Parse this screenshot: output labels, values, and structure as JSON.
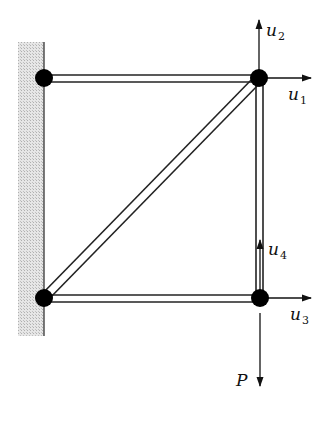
{
  "diagram": {
    "title": "",
    "nodes": [
      {
        "id": "top-left",
        "support": "wall"
      },
      {
        "id": "top-right",
        "support": "free"
      },
      {
        "id": "bottom-left",
        "support": "wall"
      },
      {
        "id": "bottom-right",
        "support": "free"
      }
    ],
    "members": [
      {
        "id": "top-bar",
        "from": "top-left",
        "to": "top-right"
      },
      {
        "id": "bottom-bar",
        "from": "bottom-left",
        "to": "bottom-right"
      },
      {
        "id": "right-bar",
        "from": "top-right",
        "to": "bottom-right"
      },
      {
        "id": "diagonal-bar",
        "from": "bottom-left",
        "to": "top-right"
      }
    ],
    "labels": {
      "u1": {
        "base": "u",
        "sub": "1"
      },
      "u2": {
        "base": "u",
        "sub": "2"
      },
      "u3": {
        "base": "u",
        "sub": "3"
      },
      "u4": {
        "base": "u",
        "sub": "4"
      },
      "load": "P"
    },
    "colors": {
      "wall_fill": "#d0d0d0",
      "ink": "#111111"
    }
  }
}
